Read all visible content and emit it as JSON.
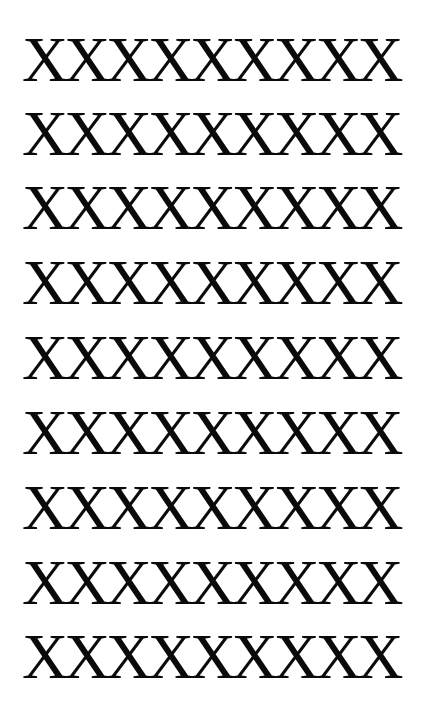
{
  "document": {
    "rows": [
      "XXXXXXXXX",
      "XXXXXXXXX",
      "XXXXXXXXX",
      "XXXXXXXXX",
      "XXXXXXXXX",
      "XXXXXXXXX",
      "XXXXXXXXX",
      "XXXXXXXXX",
      "XXXXXXXXX"
    ]
  }
}
